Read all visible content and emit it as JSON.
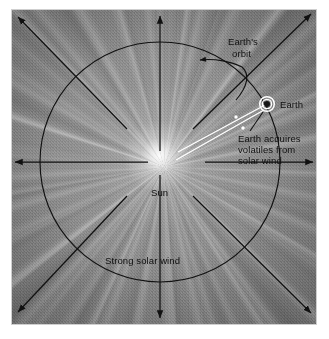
{
  "figure": {
    "type": "scientific-diagram",
    "background_color": "#8a8a8a",
    "ink_color": "#111111",
    "beam_color": "#ffffff"
  },
  "labels": {
    "earths_orbit": "Earth's\norbit",
    "earths_orbit_line1": "Earth's",
    "earths_orbit_line2": "orbit",
    "earth": "Earth",
    "acquires_line1": "Earth acquires",
    "acquires_line2": "volatiles from",
    "acquires_line3": "solar wind",
    "sun": "Sun",
    "strong_solar_wind": "Strong solar wind"
  },
  "elements": {
    "sun_glow": "central radial burst of white light",
    "orbit_circle": "thin black circle centred on the Sun",
    "earth_symbol": "small dark disc ringed in white",
    "solar_wind_beam": "narrow white cone from Sun to Earth",
    "arrows": [
      {
        "name": "arrow-up",
        "direction": "north"
      },
      {
        "name": "arrow-down",
        "direction": "south"
      },
      {
        "name": "arrow-left",
        "direction": "west"
      },
      {
        "name": "arrow-right",
        "direction": "east"
      },
      {
        "name": "arrow-upper-left",
        "direction": "northwest"
      },
      {
        "name": "arrow-upper-right",
        "direction": "northeast"
      },
      {
        "name": "arrow-lower-left",
        "direction": "southwest"
      },
      {
        "name": "arrow-lower-right",
        "direction": "southeast"
      }
    ],
    "orbit_pointer": "curved arrow from the Earth's orbit label to the orbit circle",
    "earth_leader": "short leader line from Earth symbol to the volatiles caption"
  }
}
